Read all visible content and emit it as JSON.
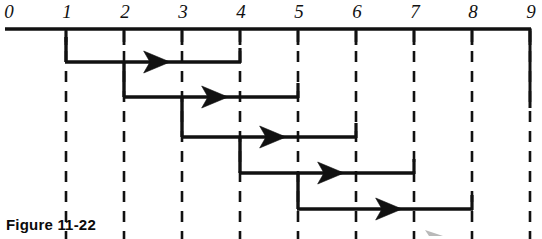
{
  "figure": {
    "caption": "Figure 11-22",
    "axis": {
      "label_style": "italic-serif",
      "min": 0,
      "max": 9,
      "tick_labels": [
        "0",
        "1",
        "2",
        "3",
        "4",
        "5",
        "6",
        "7",
        "8",
        "9"
      ],
      "tick_values": [
        0,
        1,
        2,
        3,
        4,
        5,
        6,
        7,
        8,
        9
      ]
    },
    "colors": {
      "ink": "#111111",
      "background": "#ffffff"
    },
    "bars": [
      {
        "id": "bar-1",
        "start": 1,
        "end": 4,
        "arrow_at": 2.5,
        "row": 1
      },
      {
        "id": "bar-2",
        "start": 2,
        "end": 5,
        "arrow_at": 3.5,
        "row": 2
      },
      {
        "id": "bar-3",
        "start": 3,
        "end": 6,
        "arrow_at": 4.5,
        "row": 3
      },
      {
        "id": "bar-4",
        "start": 4,
        "end": 7,
        "arrow_at": 5.5,
        "row": 4
      },
      {
        "id": "bar-5",
        "start": 5,
        "end": 8,
        "arrow_at": 6.5,
        "row": 5
      }
    ],
    "gridlines": [
      1,
      2,
      3,
      4,
      5,
      6,
      7,
      8,
      9
    ]
  },
  "chart_data": {
    "type": "bar",
    "title": "Figure 11-22",
    "xlabel": "",
    "ylabel": "",
    "xlim": [
      0,
      9
    ],
    "grid": true,
    "legend": "none",
    "categories": [
      "Task 1",
      "Task 2",
      "Task 3",
      "Task 4",
      "Task 5"
    ],
    "series": [
      {
        "name": "start",
        "values": [
          1,
          2,
          3,
          4,
          5
        ]
      },
      {
        "name": "end",
        "values": [
          4,
          5,
          6,
          7,
          8
        ]
      },
      {
        "name": "duration",
        "values": [
          3,
          3,
          3,
          3,
          3
        ]
      }
    ],
    "xticks": [
      0,
      1,
      2,
      3,
      4,
      5,
      6,
      7,
      8,
      9
    ],
    "xticklabels": [
      "0",
      "1",
      "2",
      "3",
      "4",
      "5",
      "6",
      "7",
      "8",
      "9"
    ]
  }
}
